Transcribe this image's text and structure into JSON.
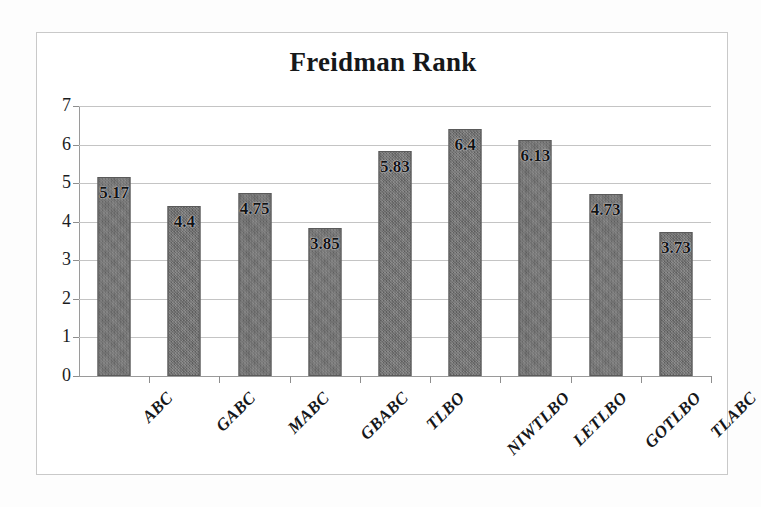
{
  "chart_data": {
    "type": "bar",
    "title": "Freidman Rank",
    "xlabel": "",
    "ylabel": "",
    "ylim": [
      0,
      7
    ],
    "ytick_step": 1,
    "grid": true,
    "legend": "none",
    "orientation": "vertical",
    "bar_label_position": "inside-top",
    "categories": [
      "ABC",
      "GABC",
      "MABC",
      "GBABC",
      "TLBO",
      "NIWTLBO",
      "LETLBO",
      "GOTLBO",
      "TLABC"
    ],
    "values": [
      5.17,
      4.4,
      4.75,
      3.85,
      5.83,
      6.4,
      6.13,
      4.73,
      3.73
    ],
    "value_labels": [
      "5.17",
      "4.4",
      "4.75",
      "3.85",
      "5.83",
      "6.4",
      "6.13",
      "4.73",
      "3.73"
    ],
    "ytick_labels": [
      "7",
      "6",
      "5",
      "4",
      "3",
      "2",
      "1",
      "0"
    ],
    "ytick_values": [
      7,
      6,
      5,
      4,
      3,
      2,
      1,
      0
    ],
    "colors": {
      "bar_fill": "#6f6f6f",
      "bar_edge": "#5a5a5a",
      "gridline": "#c4c4c4",
      "axis_line": "#9a9a9a",
      "frame_border": "#c9c9c9",
      "text": "#16181a",
      "background": "#ffffff"
    }
  }
}
